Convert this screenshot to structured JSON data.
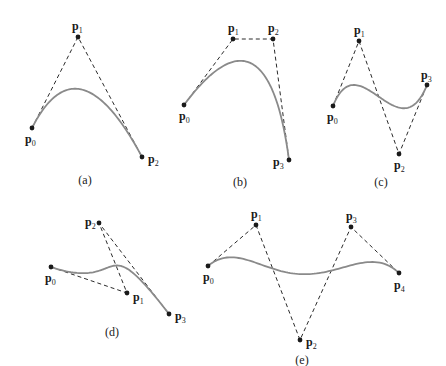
{
  "colors": {
    "curve": "#8a8a8a",
    "polygon": "#2b2b2b",
    "point": "#1a1a1a",
    "background": "#ffffff"
  },
  "figures": [
    {
      "id": "a",
      "caption": "(a)",
      "degree": 2,
      "caption_pos": [
        85,
        184
      ],
      "points": [
        {
          "name": "p",
          "sub": "0",
          "x": 32,
          "y": 128,
          "lx": 25,
          "ly": 143
        },
        {
          "name": "p",
          "sub": "1",
          "x": 78,
          "y": 37,
          "lx": 72,
          "ly": 30
        },
        {
          "name": "p",
          "sub": "2",
          "x": 142,
          "y": 157,
          "lx": 148,
          "ly": 163
        }
      ]
    },
    {
      "id": "b",
      "caption": "(b)",
      "degree": 3,
      "caption_pos": [
        240,
        186
      ],
      "points": [
        {
          "name": "p",
          "sub": "0",
          "x": 184,
          "y": 105,
          "lx": 179,
          "ly": 120
        },
        {
          "name": "p",
          "sub": "1",
          "x": 233,
          "y": 39,
          "lx": 228,
          "ly": 32
        },
        {
          "name": "p",
          "sub": "2",
          "x": 273,
          "y": 39,
          "lx": 268,
          "ly": 32
        },
        {
          "name": "p",
          "sub": "3",
          "x": 289,
          "y": 160,
          "lx": 273,
          "ly": 166
        }
      ]
    },
    {
      "id": "c",
      "caption": "(c)",
      "degree": 3,
      "caption_pos": [
        381,
        186
      ],
      "points": [
        {
          "name": "p",
          "sub": "0",
          "x": 333,
          "y": 106,
          "lx": 327,
          "ly": 121
        },
        {
          "name": "p",
          "sub": "1",
          "x": 359,
          "y": 41,
          "lx": 354,
          "ly": 34
        },
        {
          "name": "p",
          "sub": "2",
          "x": 399,
          "y": 154,
          "lx": 394,
          "ly": 169
        },
        {
          "name": "p",
          "sub": "3",
          "x": 427,
          "y": 85,
          "lx": 421,
          "ly": 79
        }
      ]
    },
    {
      "id": "d",
      "caption": "(d)",
      "degree": 3,
      "caption_pos": [
        112,
        336
      ],
      "points": [
        {
          "name": "p",
          "sub": "0",
          "x": 51,
          "y": 267,
          "lx": 45,
          "ly": 282
        },
        {
          "name": "p",
          "sub": "1",
          "x": 127,
          "y": 293,
          "lx": 133,
          "ly": 301
        },
        {
          "name": "p",
          "sub": "2",
          "x": 99,
          "y": 223,
          "lx": 85,
          "ly": 226
        },
        {
          "name": "p",
          "sub": "3",
          "x": 169,
          "y": 314,
          "lx": 175,
          "ly": 320
        }
      ]
    },
    {
      "id": "e",
      "caption": "(e)",
      "degree": 4,
      "caption_pos": [
        302,
        364
      ],
      "points": [
        {
          "name": "p",
          "sub": "0",
          "x": 208,
          "y": 266,
          "lx": 203,
          "ly": 281
        },
        {
          "name": "p",
          "sub": "1",
          "x": 256,
          "y": 225,
          "lx": 251,
          "ly": 218
        },
        {
          "name": "p",
          "sub": "2",
          "x": 300,
          "y": 340,
          "lx": 306,
          "ly": 346
        },
        {
          "name": "p",
          "sub": "3",
          "x": 351,
          "y": 227,
          "lx": 346,
          "ly": 220
        },
        {
          "name": "p",
          "sub": "4",
          "x": 399,
          "y": 273,
          "lx": 394,
          "ly": 289
        }
      ]
    }
  ]
}
